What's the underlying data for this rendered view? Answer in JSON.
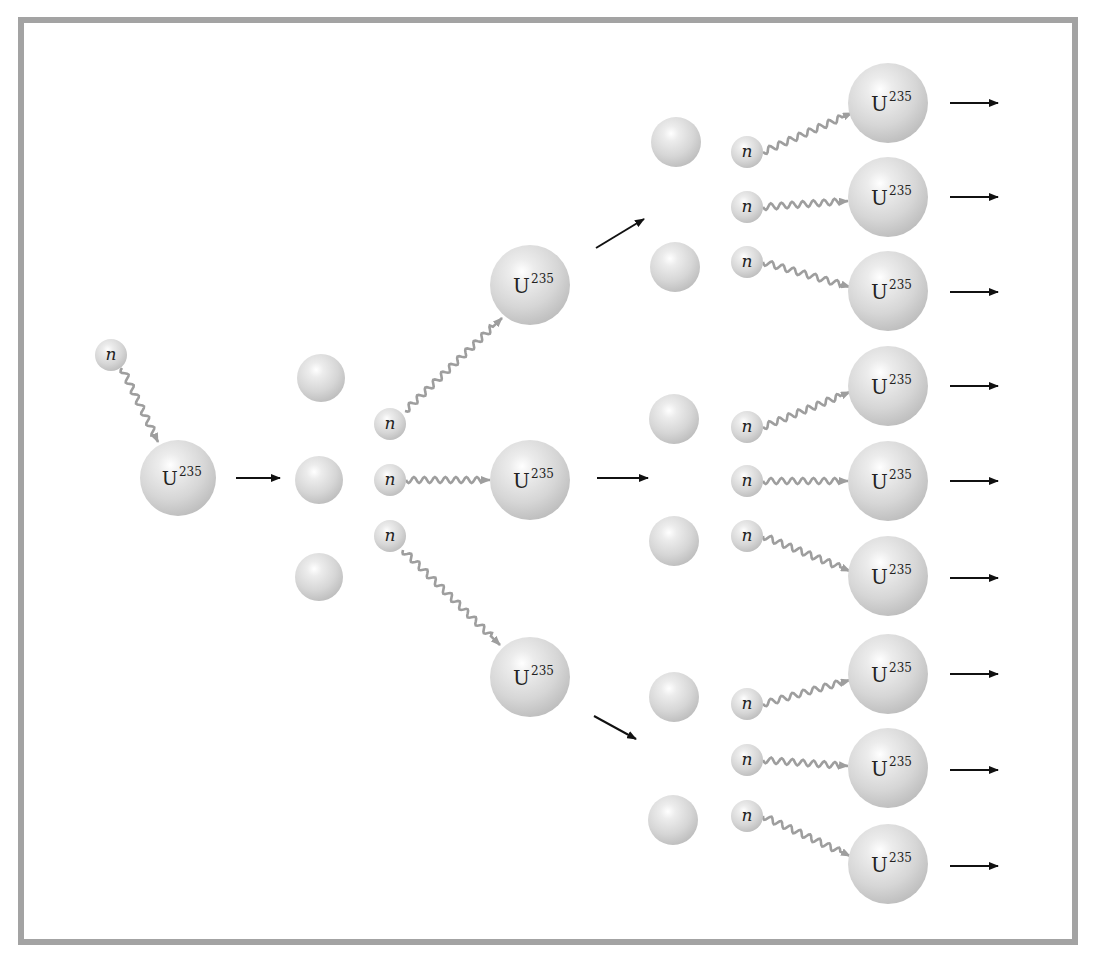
{
  "diagram": {
    "title": "",
    "colors": {
      "frame": "#a3a3a3",
      "sphere_light": "#ffffff",
      "sphere_mid": "#dadada",
      "sphere_dark": "#b9b9b9",
      "wavy_path": "#9e9e9e",
      "arrow": "#111111"
    },
    "labels": {
      "uranium": "U",
      "uranium_mass": "235",
      "neutron": "n"
    },
    "uranium": [
      {
        "id": "u0",
        "x": 178,
        "y": 478,
        "r": 38
      },
      {
        "id": "u1a",
        "x": 530,
        "y": 285,
        "r": 40
      },
      {
        "id": "u1b",
        "x": 530,
        "y": 480,
        "r": 40
      },
      {
        "id": "u1c",
        "x": 530,
        "y": 677,
        "r": 40
      },
      {
        "id": "u2a",
        "x": 888,
        "y": 103,
        "r": 40
      },
      {
        "id": "u2b",
        "x": 888,
        "y": 197,
        "r": 40
      },
      {
        "id": "u2c",
        "x": 888,
        "y": 291,
        "r": 40
      },
      {
        "id": "u2d",
        "x": 888,
        "y": 386,
        "r": 40
      },
      {
        "id": "u2e",
        "x": 888,
        "y": 481,
        "r": 40
      },
      {
        "id": "u2f",
        "x": 888,
        "y": 576,
        "r": 40
      },
      {
        "id": "u2g",
        "x": 888,
        "y": 674,
        "r": 40
      },
      {
        "id": "u2h",
        "x": 888,
        "y": 768,
        "r": 40
      },
      {
        "id": "u2i",
        "x": 888,
        "y": 864,
        "r": 40
      }
    ],
    "neutrons": [
      {
        "id": "n0",
        "x": 111,
        "y": 355,
        "r": 16
      },
      {
        "id": "n1a",
        "x": 390,
        "y": 424,
        "r": 16
      },
      {
        "id": "n1b",
        "x": 390,
        "y": 480,
        "r": 16
      },
      {
        "id": "n1c",
        "x": 390,
        "y": 536,
        "r": 16
      },
      {
        "id": "n2a",
        "x": 747,
        "y": 152,
        "r": 16
      },
      {
        "id": "n2b",
        "x": 747,
        "y": 207,
        "r": 16
      },
      {
        "id": "n2c",
        "x": 747,
        "y": 262,
        "r": 16
      },
      {
        "id": "n2d",
        "x": 747,
        "y": 427,
        "r": 16
      },
      {
        "id": "n2e",
        "x": 747,
        "y": 481,
        "r": 16
      },
      {
        "id": "n2f",
        "x": 747,
        "y": 536,
        "r": 16
      },
      {
        "id": "n2g",
        "x": 747,
        "y": 704,
        "r": 16
      },
      {
        "id": "n2h",
        "x": 747,
        "y": 760,
        "r": 16
      },
      {
        "id": "n2i",
        "x": 747,
        "y": 816,
        "r": 16
      }
    ],
    "fragments": [
      {
        "id": "f1a",
        "x": 321,
        "y": 378,
        "r": 24
      },
      {
        "id": "f1b",
        "x": 319,
        "y": 480,
        "r": 24
      },
      {
        "id": "f1c",
        "x": 319,
        "y": 577,
        "r": 24
      },
      {
        "id": "f2a",
        "x": 676,
        "y": 142,
        "r": 25
      },
      {
        "id": "f2b",
        "x": 675,
        "y": 267,
        "r": 25
      },
      {
        "id": "f2c",
        "x": 674,
        "y": 419,
        "r": 25
      },
      {
        "id": "f2d",
        "x": 674,
        "y": 541,
        "r": 25
      },
      {
        "id": "f2e",
        "x": 674,
        "y": 697,
        "r": 25
      },
      {
        "id": "f2f",
        "x": 673,
        "y": 820,
        "r": 25
      }
    ],
    "wavy_paths": [
      {
        "from": [
          122,
          368
        ],
        "to": [
          158,
          442
        ]
      },
      {
        "from": [
          405,
          411
        ],
        "to": [
          502,
          318
        ]
      },
      {
        "from": [
          406,
          480
        ],
        "to": [
          490,
          480
        ]
      },
      {
        "from": [
          403,
          550
        ],
        "to": [
          500,
          645
        ]
      },
      {
        "from": [
          763,
          152
        ],
        "to": [
          852,
          113
        ]
      },
      {
        "from": [
          763,
          207
        ],
        "to": [
          848,
          201
        ]
      },
      {
        "from": [
          763,
          262
        ],
        "to": [
          850,
          287
        ]
      },
      {
        "from": [
          763,
          427
        ],
        "to": [
          850,
          392
        ]
      },
      {
        "from": [
          763,
          481
        ],
        "to": [
          848,
          481
        ]
      },
      {
        "from": [
          763,
          536
        ],
        "to": [
          850,
          571
        ]
      },
      {
        "from": [
          763,
          704
        ],
        "to": [
          850,
          680
        ]
      },
      {
        "from": [
          763,
          760
        ],
        "to": [
          848,
          766
        ]
      },
      {
        "from": [
          763,
          816
        ],
        "to": [
          850,
          856
        ]
      }
    ],
    "arrows": [
      {
        "from": [
          236,
          478
        ],
        "to": [
          280,
          478
        ]
      },
      {
        "from": [
          596,
          248
        ],
        "to": [
          644,
          219
        ]
      },
      {
        "from": [
          597,
          478
        ],
        "to": [
          648,
          478
        ]
      },
      {
        "from": [
          594,
          716
        ],
        "to": [
          636,
          739
        ]
      },
      {
        "from": [
          950,
          103
        ],
        "to": [
          998,
          103
        ]
      },
      {
        "from": [
          950,
          197
        ],
        "to": [
          998,
          197
        ]
      },
      {
        "from": [
          950,
          292
        ],
        "to": [
          998,
          292
        ]
      },
      {
        "from": [
          950,
          386
        ],
        "to": [
          998,
          386
        ]
      },
      {
        "from": [
          950,
          481
        ],
        "to": [
          998,
          481
        ]
      },
      {
        "from": [
          950,
          578
        ],
        "to": [
          998,
          578
        ]
      },
      {
        "from": [
          950,
          674
        ],
        "to": [
          998,
          674
        ]
      },
      {
        "from": [
          950,
          770
        ],
        "to": [
          998,
          770
        ]
      },
      {
        "from": [
          950,
          866
        ],
        "to": [
          998,
          866
        ]
      }
    ]
  }
}
